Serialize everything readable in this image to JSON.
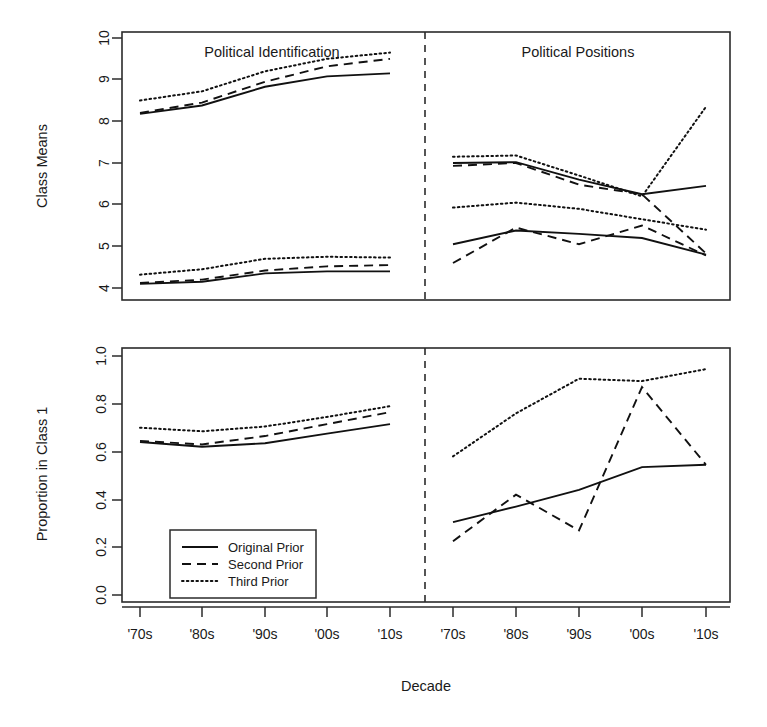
{
  "figure": {
    "xlabel": "Decade",
    "panels": [
      {
        "id": "class-means",
        "ylabel": "Class Means",
        "titles": [
          "Political Identification",
          "Political Positions"
        ]
      },
      {
        "id": "proportion",
        "ylabel": "Proportion in Class 1",
        "titles": [
          "",
          ""
        ]
      }
    ],
    "legend": {
      "items": [
        {
          "label": "Original Prior",
          "style": "solid"
        },
        {
          "label": "Second Prior",
          "style": "dashed"
        },
        {
          "label": "Third Prior",
          "style": "dotted"
        }
      ]
    }
  },
  "chart_data": [
    {
      "type": "line",
      "id": "class-means-political-identification",
      "title": "Political Identification",
      "xlabel": "Decade",
      "ylabel": "Class Means",
      "categories": [
        "'70s",
        "'80s",
        "'90s",
        "'00s",
        "'10s"
      ],
      "ylim": [
        3.8,
        10.0
      ],
      "yticks": [
        4,
        5,
        6,
        7,
        8,
        9,
        10
      ],
      "grid": false,
      "legend_position": "bottom-left-of-lower-panel",
      "series": [
        {
          "name": "Original Prior",
          "style": "solid",
          "group": "high",
          "values": [
            8.18,
            8.38,
            8.83,
            9.08,
            9.15
          ]
        },
        {
          "name": "Second Prior",
          "style": "dashed",
          "group": "high",
          "values": [
            8.2,
            8.45,
            8.95,
            9.32,
            9.5
          ]
        },
        {
          "name": "Third Prior",
          "style": "dotted",
          "group": "high",
          "values": [
            8.5,
            8.72,
            9.2,
            9.5,
            9.65
          ]
        },
        {
          "name": "Original Prior",
          "style": "solid",
          "group": "low",
          "values": [
            4.1,
            4.15,
            4.35,
            4.4,
            4.4
          ]
        },
        {
          "name": "Second Prior",
          "style": "dashed",
          "group": "low",
          "values": [
            4.12,
            4.2,
            4.42,
            4.52,
            4.55
          ]
        },
        {
          "name": "Third Prior",
          "style": "dotted",
          "group": "low",
          "values": [
            4.32,
            4.45,
            4.7,
            4.75,
            4.73
          ]
        }
      ]
    },
    {
      "type": "line",
      "id": "class-means-political-positions",
      "title": "Political Positions",
      "xlabel": "Decade",
      "ylabel": "Class Means",
      "categories": [
        "'70s",
        "'80s",
        "'90s",
        "'00s",
        "'10s"
      ],
      "ylim": [
        3.8,
        10.0
      ],
      "yticks": [
        4,
        5,
        6,
        7,
        8,
        9,
        10
      ],
      "grid": false,
      "series": [
        {
          "name": "Original Prior",
          "style": "solid",
          "group": "high",
          "values": [
            7.0,
            7.02,
            6.6,
            6.25,
            6.45
          ]
        },
        {
          "name": "Second Prior",
          "style": "dashed",
          "group": "high",
          "values": [
            6.93,
            7.0,
            6.48,
            6.25,
            4.83
          ]
        },
        {
          "name": "Third Prior",
          "style": "dotted",
          "group": "high",
          "values": [
            7.15,
            7.18,
            6.7,
            6.2,
            8.35
          ]
        },
        {
          "name": "Original Prior",
          "style": "solid",
          "group": "low",
          "values": [
            5.05,
            5.38,
            5.3,
            5.2,
            4.8
          ]
        },
        {
          "name": "Second Prior",
          "style": "dashed",
          "group": "low",
          "values": [
            4.6,
            5.45,
            5.05,
            5.5,
            4.78
          ]
        },
        {
          "name": "Third Prior",
          "style": "dotted",
          "group": "low",
          "values": [
            5.93,
            6.05,
            5.9,
            5.65,
            5.4
          ]
        }
      ]
    },
    {
      "type": "line",
      "id": "proportion-political-identification",
      "title": "Political Identification",
      "xlabel": "Decade",
      "ylabel": "Proportion in Class 1",
      "categories": [
        "'70s",
        "'80s",
        "'90s",
        "'00s",
        "'10s"
      ],
      "ylim": [
        0.0,
        1.0
      ],
      "yticks": [
        0.0,
        0.2,
        0.4,
        0.6,
        0.8,
        1.0
      ],
      "grid": false,
      "series": [
        {
          "name": "Original Prior",
          "style": "solid",
          "values": [
            0.64,
            0.62,
            0.635,
            0.675,
            0.715
          ]
        },
        {
          "name": "Second Prior",
          "style": "dashed",
          "values": [
            0.645,
            0.63,
            0.665,
            0.715,
            0.765
          ]
        },
        {
          "name": "Third Prior",
          "style": "dotted",
          "values": [
            0.7,
            0.685,
            0.705,
            0.745,
            0.79
          ]
        }
      ]
    },
    {
      "type": "line",
      "id": "proportion-political-positions",
      "title": "Political Positions",
      "xlabel": "Decade",
      "ylabel": "Proportion in Class 1",
      "categories": [
        "'70s",
        "'80s",
        "'90s",
        "'00s",
        "'10s"
      ],
      "ylim": [
        0.0,
        1.0
      ],
      "yticks": [
        0.0,
        0.2,
        0.4,
        0.6,
        0.8,
        1.0
      ],
      "grid": false,
      "series": [
        {
          "name": "Original Prior",
          "style": "solid",
          "values": [
            0.305,
            0.37,
            0.44,
            0.535,
            0.545
          ]
        },
        {
          "name": "Second Prior",
          "style": "dashed",
          "values": [
            0.225,
            0.42,
            0.27,
            0.87,
            0.545
          ]
        },
        {
          "name": "Third Prior",
          "style": "dotted",
          "values": [
            0.58,
            0.76,
            0.905,
            0.895,
            0.945
          ]
        }
      ]
    }
  ],
  "axis": {
    "top_yticks": [
      "4",
      "5",
      "6",
      "7",
      "8",
      "9",
      "10"
    ],
    "bottom_yticks": [
      "0.0",
      "0.2",
      "0.4",
      "0.6",
      "0.8",
      "1.0"
    ],
    "xticks": [
      "'70s",
      "'80s",
      "'90s",
      "'00s",
      "'10s"
    ]
  }
}
